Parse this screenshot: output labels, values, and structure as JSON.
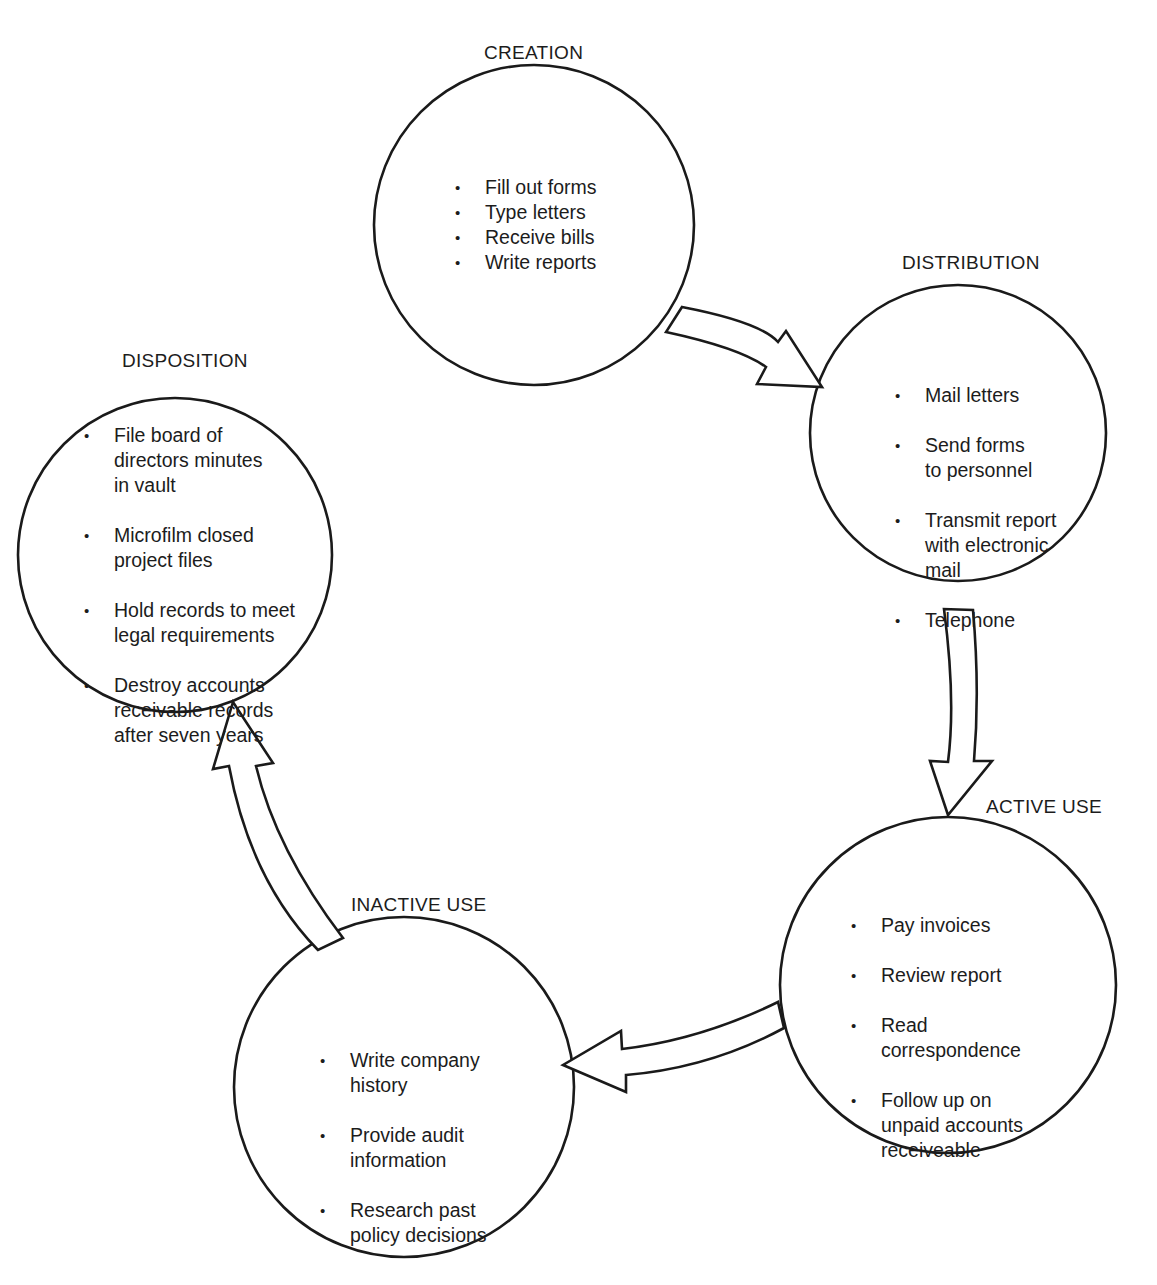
{
  "diagram": {
    "type": "records-life-cycle",
    "stages": [
      {
        "id": "creation",
        "title": "CREATION",
        "items": [
          "Fill out forms",
          "Type letters",
          "Receive bills",
          "Write reports"
        ]
      },
      {
        "id": "distribution",
        "title": "DISTRIBUTION",
        "items": [
          "Mail letters",
          "Send forms\nto personnel",
          "Transmit report\nwith electronic\nmail",
          "Telephone"
        ]
      },
      {
        "id": "active_use",
        "title": "ACTIVE USE",
        "items": [
          "Pay invoices",
          "Review report",
          "Read\ncorrespondence",
          "Follow up on\nunpaid accounts\nreceiveable"
        ]
      },
      {
        "id": "inactive_use",
        "title": "INACTIVE USE",
        "items": [
          "Write company\nhistory",
          "Provide audit\ninformation",
          "Research past\npolicy decisions"
        ]
      },
      {
        "id": "disposition",
        "title": "DISPOSITION",
        "items": [
          "File board of\ndirectors minutes\nin vault",
          "Microfilm closed\nproject files",
          "Hold records to meet\nlegal requirements",
          "Destroy accounts\nreceivable records\nafter seven years"
        ]
      }
    ],
    "arrows": [
      {
        "from": "creation",
        "to": "distribution"
      },
      {
        "from": "distribution",
        "to": "active_use"
      },
      {
        "from": "active_use",
        "to": "inactive_use"
      },
      {
        "from": "inactive_use",
        "to": "disposition"
      }
    ],
    "colors": {
      "stroke": "#1a1a1a",
      "background": "#ffffff"
    }
  }
}
